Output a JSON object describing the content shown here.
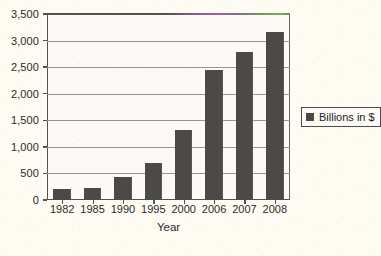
{
  "chart_data": {
    "type": "bar",
    "title": "",
    "xlabel": "Year",
    "ylabel": "",
    "categories": [
      "1982",
      "1985",
      "1990",
      "1995",
      "2000",
      "2006",
      "2007",
      "2008"
    ],
    "values": [
      200,
      230,
      430,
      690,
      1310,
      2450,
      2790,
      3170
    ],
    "series": [
      {
        "name": "Billions in $",
        "values": [
          200,
          230,
          430,
          690,
          1310,
          2450,
          2790,
          3170
        ]
      }
    ],
    "ylim": [
      0,
      3500
    ],
    "ytick_step": 500,
    "ytick_labels": [
      "0",
      "500",
      "1,000",
      "1,500",
      "2,000",
      "2,500",
      "3,000",
      "3,500"
    ],
    "ytick_values": [
      0,
      500,
      1000,
      1500,
      2000,
      2500,
      3000,
      3500
    ],
    "grid": true,
    "legend": {
      "position": "right",
      "entries": [
        {
          "label": "Billions in $",
          "color": "#4c4a46",
          "swatch": "legend-swatch"
        }
      ]
    },
    "colors": {
      "bar": "#4c4a46",
      "axis": "#55514c",
      "gridline": "#9a958d",
      "plot_background": "#fbfaf7",
      "page_background": "#fdfbf2",
      "text": "#2b2b2b"
    }
  }
}
